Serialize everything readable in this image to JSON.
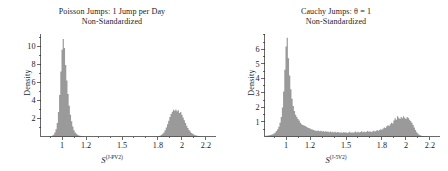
{
  "figure": {
    "background_color": "#ffffff",
    "hist_fill_color": "#9a9a9a",
    "axis_color": "#2a2a2a"
  },
  "panels": [
    {
      "id": "poisson-jumps",
      "title_line1": "Poisson Jumps: 1 Jump per Day",
      "title_line2": "Non-Standardized",
      "ylabel": "Density",
      "xlabel_base": "S",
      "xlabel_sup": "(J-PV2)",
      "chart_data": {
        "type": "bar",
        "title": "Poisson Jumps: 1 Jump per Day Non-Standardized",
        "subtitle": "Non-Standardized",
        "xlabel": "S^(J-PV2)",
        "ylabel": "Density",
        "grid": false,
        "legend": "none",
        "xlim": [
          0.82,
          2.28
        ],
        "ylim": [
          0,
          11.4
        ],
        "xticks": [
          1,
          1.2,
          1.5,
          1.8,
          2,
          2.2
        ],
        "xticklabels": [
          "1",
          "1.2",
          "1.5",
          "1.8",
          "2",
          "2.2"
        ],
        "yticks": [
          2,
          4,
          6,
          8,
          10
        ],
        "yticklabels": [
          "2",
          "4",
          "6",
          "8",
          "10"
        ],
        "annotations": "Bimodal density: narrow spike near 1.0 peaking about 10.8, broader mode near 2.0 peaking about 3.0",
        "bin_width": 0.01,
        "x": [
          0.83,
          0.84,
          0.85,
          0.86,
          0.87,
          0.88,
          0.89,
          0.9,
          0.91,
          0.92,
          0.93,
          0.94,
          0.95,
          0.96,
          0.97,
          0.98,
          0.99,
          1.0,
          1.01,
          1.02,
          1.03,
          1.04,
          1.05,
          1.06,
          1.07,
          1.08,
          1.09,
          1.1,
          1.11,
          1.12,
          1.13,
          1.14,
          1.15,
          1.16,
          1.17,
          1.18,
          1.19,
          1.2,
          1.21,
          1.22,
          1.23,
          1.24,
          1.25,
          1.26,
          1.27,
          1.28,
          1.29,
          1.3,
          1.31,
          1.32,
          1.33,
          1.34,
          1.35,
          1.36,
          1.37,
          1.38,
          1.39,
          1.4,
          1.41,
          1.42,
          1.43,
          1.44,
          1.45,
          1.46,
          1.47,
          1.48,
          1.49,
          1.5,
          1.51,
          1.52,
          1.53,
          1.54,
          1.55,
          1.56,
          1.57,
          1.58,
          1.59,
          1.6,
          1.61,
          1.62,
          1.63,
          1.64,
          1.65,
          1.66,
          1.67,
          1.68,
          1.69,
          1.7,
          1.71,
          1.72,
          1.73,
          1.74,
          1.75,
          1.76,
          1.77,
          1.78,
          1.79,
          1.8,
          1.81,
          1.82,
          1.83,
          1.84,
          1.85,
          1.86,
          1.87,
          1.88,
          1.89,
          1.9,
          1.91,
          1.92,
          1.93,
          1.94,
          1.95,
          1.96,
          1.97,
          1.98,
          1.99,
          2.0,
          2.01,
          2.02,
          2.03,
          2.04,
          2.05,
          2.06,
          2.07,
          2.08,
          2.09,
          2.1,
          2.11,
          2.12,
          2.13,
          2.14,
          2.15,
          2.16,
          2.17,
          2.18,
          2.19,
          2.2,
          2.21,
          2.22,
          2.23,
          2.24,
          2.25
        ],
        "values": [
          0.0,
          0.0,
          0.0,
          0.0,
          0.0,
          0.0,
          0.0,
          0.02,
          0.05,
          0.1,
          0.2,
          0.45,
          0.8,
          1.5,
          2.7,
          4.6,
          7.2,
          9.6,
          10.8,
          9.8,
          7.9,
          6.2,
          4.7,
          3.4,
          2.4,
          1.7,
          1.1,
          0.7,
          0.45,
          0.3,
          0.2,
          0.12,
          0.08,
          0.05,
          0.03,
          0.02,
          0.01,
          0.01,
          0.0,
          0.0,
          0.0,
          0.0,
          0.0,
          0.0,
          0.0,
          0.0,
          0.0,
          0.0,
          0.0,
          0.0,
          0.0,
          0.0,
          0.0,
          0.0,
          0.0,
          0.0,
          0.0,
          0.0,
          0.0,
          0.0,
          0.0,
          0.0,
          0.0,
          0.0,
          0.0,
          0.0,
          0.0,
          0.0,
          0.0,
          0.0,
          0.0,
          0.0,
          0.0,
          0.0,
          0.0,
          0.0,
          0.0,
          0.0,
          0.0,
          0.0,
          0.0,
          0.0,
          0.0,
          0.0,
          0.0,
          0.0,
          0.0,
          0.0,
          0.0,
          0.0,
          0.0,
          0.0,
          0.0,
          0.0,
          0.0,
          0.0,
          0.0,
          0.02,
          0.05,
          0.1,
          0.18,
          0.3,
          0.45,
          0.7,
          1.0,
          1.35,
          1.75,
          2.15,
          2.5,
          2.75,
          2.95,
          2.85,
          3.0,
          2.8,
          2.9,
          2.6,
          2.7,
          2.4,
          2.1,
          1.8,
          1.5,
          1.2,
          0.95,
          0.72,
          0.55,
          0.4,
          0.3,
          0.22,
          0.15,
          0.1,
          0.07,
          0.05,
          0.03,
          0.02,
          0.01,
          0.01,
          0.0,
          0.0,
          0.0,
          0.0,
          0.0,
          0.0
        ]
      }
    },
    {
      "id": "cauchy-jumps",
      "title_line1": "Cauchy Jumps: θ = 1",
      "title_line2": "Non-Standardized",
      "ylabel": "Density",
      "xlabel_base": "S",
      "xlabel_sup": "(J-5V2)",
      "chart_data": {
        "type": "bar",
        "title": "Cauchy Jumps: θ = 1 Non-Standardized",
        "subtitle": "Non-Standardized",
        "xlabel": "S^(J-5V2)",
        "ylabel": "Density",
        "grid": false,
        "legend": "none",
        "xlim": [
          0.82,
          2.28
        ],
        "ylim": [
          0,
          7.1
        ],
        "xticks": [
          1,
          1.2,
          1.5,
          1.8,
          2,
          2.2
        ],
        "xticklabels": [
          "1",
          "1.2",
          "1.5",
          "1.8",
          "2",
          "2.2"
        ],
        "yticks": [
          1,
          2,
          3,
          4,
          5,
          6
        ],
        "yticklabels": [
          "1",
          "2",
          "3",
          "4",
          "5",
          "6"
        ],
        "annotations": "Sharp spike near 1.0 peaking about 6.8, heavy noisy right tail with secondary bump near 1.9-2.0 reaching about 1.4",
        "bin_width": 0.01,
        "x": [
          0.83,
          0.84,
          0.85,
          0.86,
          0.87,
          0.88,
          0.89,
          0.9,
          0.91,
          0.92,
          0.93,
          0.94,
          0.95,
          0.96,
          0.97,
          0.98,
          0.99,
          1.0,
          1.01,
          1.02,
          1.03,
          1.04,
          1.05,
          1.06,
          1.07,
          1.08,
          1.09,
          1.1,
          1.11,
          1.12,
          1.13,
          1.14,
          1.15,
          1.16,
          1.17,
          1.18,
          1.19,
          1.2,
          1.21,
          1.22,
          1.23,
          1.24,
          1.25,
          1.26,
          1.27,
          1.28,
          1.29,
          1.3,
          1.31,
          1.32,
          1.33,
          1.34,
          1.35,
          1.36,
          1.37,
          1.38,
          1.39,
          1.4,
          1.41,
          1.42,
          1.43,
          1.44,
          1.45,
          1.46,
          1.47,
          1.48,
          1.49,
          1.5,
          1.51,
          1.52,
          1.53,
          1.54,
          1.55,
          1.56,
          1.57,
          1.58,
          1.59,
          1.6,
          1.61,
          1.62,
          1.63,
          1.64,
          1.65,
          1.66,
          1.67,
          1.68,
          1.69,
          1.7,
          1.71,
          1.72,
          1.73,
          1.74,
          1.75,
          1.76,
          1.77,
          1.78,
          1.79,
          1.8,
          1.81,
          1.82,
          1.83,
          1.84,
          1.85,
          1.86,
          1.87,
          1.88,
          1.89,
          1.9,
          1.91,
          1.92,
          1.93,
          1.94,
          1.95,
          1.96,
          1.97,
          1.98,
          1.99,
          2.0,
          2.01,
          2.02,
          2.03,
          2.04,
          2.05,
          2.06,
          2.07,
          2.08,
          2.09,
          2.1,
          2.11,
          2.12,
          2.13,
          2.14,
          2.15,
          2.16,
          2.17,
          2.18,
          2.19,
          2.2,
          2.21,
          2.22,
          2.23,
          2.24,
          2.25
        ],
        "values": [
          0.05,
          0.06,
          0.07,
          0.08,
          0.1,
          0.12,
          0.15,
          0.2,
          0.28,
          0.38,
          0.5,
          0.68,
          0.95,
          1.35,
          2.0,
          3.1,
          4.6,
          6.2,
          6.8,
          5.4,
          4.2,
          3.25,
          2.6,
          2.1,
          1.75,
          1.5,
          1.35,
          1.2,
          1.1,
          0.95,
          0.85,
          0.8,
          0.75,
          0.72,
          0.68,
          0.62,
          0.58,
          0.55,
          0.5,
          0.48,
          0.45,
          0.42,
          0.4,
          0.38,
          0.42,
          0.36,
          0.4,
          0.34,
          0.38,
          0.33,
          0.36,
          0.32,
          0.35,
          0.3,
          0.34,
          0.29,
          0.33,
          0.28,
          0.32,
          0.27,
          0.31,
          0.3,
          0.26,
          0.3,
          0.25,
          0.29,
          0.28,
          0.3,
          0.24,
          0.28,
          0.32,
          0.26,
          0.3,
          0.25,
          0.29,
          0.34,
          0.28,
          0.32,
          0.27,
          0.31,
          0.36,
          0.3,
          0.34,
          0.29,
          0.33,
          0.38,
          0.32,
          0.36,
          0.31,
          0.35,
          0.4,
          0.34,
          0.38,
          0.45,
          0.4,
          0.44,
          0.5,
          0.46,
          0.55,
          0.62,
          0.58,
          0.7,
          0.78,
          0.72,
          0.85,
          0.95,
          0.9,
          1.1,
          1.25,
          1.15,
          1.4,
          1.3,
          1.2,
          1.35,
          1.25,
          1.4,
          1.3,
          1.2,
          1.35,
          1.28,
          1.15,
          1.05,
          0.95,
          0.8,
          0.62,
          0.45,
          0.3,
          0.2,
          0.12,
          0.08,
          0.05,
          0.03,
          0.02,
          0.01,
          0.01,
          0.0,
          0.0,
          0.0,
          0.0,
          0.0,
          0.0
        ]
      }
    }
  ]
}
